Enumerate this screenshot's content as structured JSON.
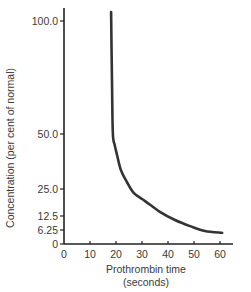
{
  "chart_data": {
    "type": "line",
    "title": "",
    "xlabel": "Prothrombin time (seconds)",
    "xlabel_lines": [
      "Prothrombin time",
      "(seconds)"
    ],
    "ylabel": "Concentration (per cent of normal)",
    "x_ticks": [
      0,
      10,
      20,
      30,
      40,
      50,
      60
    ],
    "x_tick_labels": [
      "0",
      "10",
      "20",
      "30",
      "40",
      "50",
      "60"
    ],
    "y_ticks": [
      0,
      6.25,
      12.5,
      25.0,
      50.0,
      100.0
    ],
    "y_tick_labels": [
      "0",
      "6.25",
      "12.5",
      "25.0",
      "50.0",
      "100.0"
    ],
    "xlim": [
      0,
      65
    ],
    "ylim": [
      0,
      105
    ],
    "y_scale": "non-linear (compressed ticks: 0, 6.25, 12.5, 25, 50, 100)",
    "grid": false,
    "legend": null,
    "series": [
      {
        "name": "Concentration vs prothrombin time",
        "color": "#333333",
        "x": [
          18.1,
          18.5,
          18.8,
          19.5,
          20.4,
          21.9,
          24.2,
          26.9,
          31.2,
          36.9,
          42.7,
          48.5,
          54.2,
          60.8
        ],
        "y": [
          104,
          70,
          50,
          45,
          40.5,
          33.6,
          28.2,
          23.1,
          19.4,
          14.4,
          10.7,
          8.0,
          5.8,
          5.0
        ]
      }
    ]
  },
  "plot_geometry": {
    "x_axis_y": 244,
    "y_axis_x": 64,
    "x_px_per_unit": 2.6,
    "y_tick_pixels": {
      "0": 244,
      "6.25": 230,
      "12.5": 216,
      "25.0": 189,
      "50.0": 134,
      "100.0": 21
    }
  }
}
